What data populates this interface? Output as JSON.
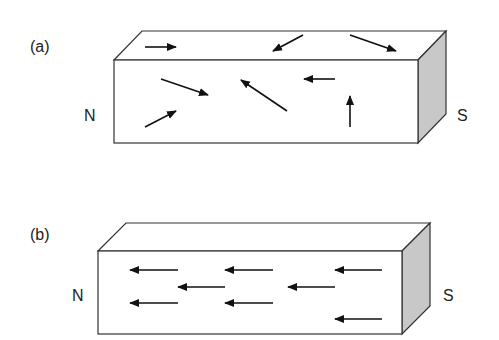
{
  "panels": [
    {
      "id": "a",
      "label": "(a)",
      "north_label": "N",
      "south_label": "S",
      "description": "Unmagnetized bar: domains randomly oriented",
      "box": {
        "front": [
          114,
          60,
          418,
          143
        ],
        "back_dx": 28,
        "back_dy": -29
      },
      "arrows": [
        {
          "x1": 145,
          "y1": 47,
          "x2": 176,
          "y2": 47
        },
        {
          "x1": 303,
          "y1": 35,
          "x2": 273,
          "y2": 51
        },
        {
          "x1": 350,
          "y1": 35,
          "x2": 396,
          "y2": 51
        },
        {
          "x1": 161,
          "y1": 79,
          "x2": 208,
          "y2": 95
        },
        {
          "x1": 287,
          "y1": 111,
          "x2": 241,
          "y2": 80
        },
        {
          "x1": 335,
          "y1": 79,
          "x2": 304,
          "y2": 79
        },
        {
          "x1": 145,
          "y1": 127,
          "x2": 176,
          "y2": 111
        },
        {
          "x1": 350,
          "y1": 127,
          "x2": 350,
          "y2": 96
        }
      ]
    },
    {
      "id": "b",
      "label": "(b)",
      "north_label": "N",
      "south_label": "S",
      "description": "Magnetized bar: domains aligned",
      "box": {
        "front": [
          98,
          251,
          402,
          334
        ],
        "back_dx": 28,
        "back_dy": -28
      },
      "arrows": [
        {
          "x1": 178,
          "y1": 270,
          "x2": 130,
          "y2": 270
        },
        {
          "x1": 273,
          "y1": 270,
          "x2": 225,
          "y2": 270
        },
        {
          "x1": 382,
          "y1": 270,
          "x2": 335,
          "y2": 270
        },
        {
          "x1": 225,
          "y1": 287,
          "x2": 178,
          "y2": 287
        },
        {
          "x1": 335,
          "y1": 287,
          "x2": 288,
          "y2": 287
        },
        {
          "x1": 178,
          "y1": 303,
          "x2": 130,
          "y2": 303
        },
        {
          "x1": 273,
          "y1": 303,
          "x2": 225,
          "y2": 303
        },
        {
          "x1": 382,
          "y1": 319,
          "x2": 335,
          "y2": 319
        }
      ]
    }
  ],
  "colors": {
    "stroke": "#333333",
    "side_fill": "#c8c8c8",
    "arrow": "#111111"
  }
}
